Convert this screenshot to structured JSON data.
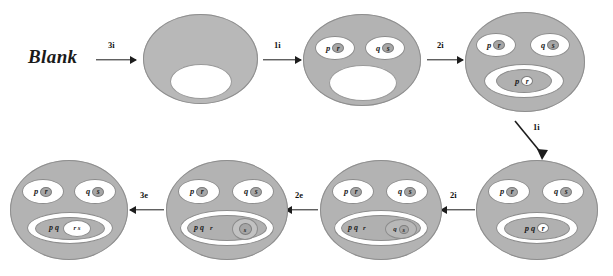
{
  "diagram": {
    "title_label": "Blank",
    "background": "#ffffff",
    "blob_fill": "#b3b3b3",
    "oval_fill": "#ffffff",
    "ink": "#1d1d1d",
    "start": {
      "label": "Blank"
    },
    "arrows": [
      {
        "id": "a1",
        "label": "3i",
        "direction": "right"
      },
      {
        "id": "a2",
        "label": "1i",
        "direction": "right"
      },
      {
        "id": "a3",
        "label": "2i",
        "direction": "right"
      },
      {
        "id": "a4",
        "label": "1i",
        "direction": "down-right"
      },
      {
        "id": "a5",
        "label": "2i",
        "direction": "left"
      },
      {
        "id": "a6",
        "label": "2e",
        "direction": "left"
      },
      {
        "id": "a7",
        "label": "3e",
        "direction": "left"
      }
    ],
    "stages": [
      {
        "id": "stage-1",
        "name": "empty-blob",
        "top_ovals": [],
        "bottom_oval": null,
        "has_mouth": true
      },
      {
        "id": "stage-2",
        "name": "blob-with-two-top-ovals",
        "top_ovals": [
          {
            "plain": "p",
            "disc": "r"
          },
          {
            "plain": "q",
            "disc": "s"
          }
        ],
        "bottom_oval": null,
        "has_mouth": true
      },
      {
        "id": "stage-3",
        "name": "blob-with-bottom-oval-pr",
        "top_ovals": [
          {
            "plain": "p",
            "disc": "r"
          },
          {
            "plain": "q",
            "disc": "s"
          }
        ],
        "bottom_oval": {
          "plain": "p",
          "disc": "r",
          "nested": null
        },
        "has_mouth": false
      },
      {
        "id": "stage-4",
        "name": "blob-bottom-pq-r",
        "top_ovals": [
          {
            "plain": "p",
            "disc": "r"
          },
          {
            "plain": "q",
            "disc": "s"
          }
        ],
        "bottom_oval": {
          "plain": "p q",
          "disc": "r",
          "nested": null
        },
        "has_mouth": false
      },
      {
        "id": "stage-5",
        "name": "blob-bottom-pq-r-nested-qs",
        "top_ovals": [
          {
            "plain": "p",
            "disc": "r"
          },
          {
            "plain": "q",
            "disc": "s"
          }
        ],
        "bottom_oval": {
          "plain": "p q",
          "disc": "r",
          "nested": {
            "plain": "q",
            "disc": "s"
          }
        },
        "has_mouth": false
      },
      {
        "id": "stage-6",
        "name": "blob-bottom-pq-r-nested-q-s-deep",
        "top_ovals": [
          {
            "plain": "p",
            "disc": "r"
          },
          {
            "plain": "q",
            "disc": "s"
          }
        ],
        "bottom_oval": {
          "plain": "p q",
          "disc": "r",
          "nested": {
            "plain": "q",
            "disc": "s"
          }
        },
        "has_mouth": false
      },
      {
        "id": "stage-7",
        "name": "blob-bottom-pq-rs",
        "top_ovals": [
          {
            "plain": "p",
            "disc": "r"
          },
          {
            "plain": "q",
            "disc": "s"
          }
        ],
        "bottom_oval": {
          "plain": "p q",
          "disc": "r s",
          "nested": null
        },
        "has_mouth": false
      }
    ]
  }
}
